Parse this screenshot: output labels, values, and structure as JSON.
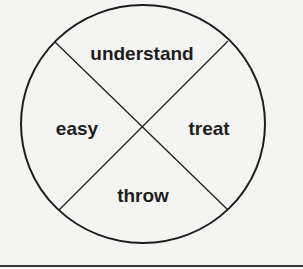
{
  "diagram": {
    "type": "circle-divided-into-quadrants",
    "circle": {
      "cx": 143,
      "cy": 124,
      "rx": 122,
      "ry": 119
    },
    "dividers": [
      {
        "x1": 55,
        "y1": 42,
        "x2": 228,
        "y2": 210
      },
      {
        "x1": 228,
        "y1": 41,
        "x2": 59,
        "y2": 210
      }
    ],
    "quadrants": {
      "top": {
        "label": "understand",
        "x": 142,
        "y": 53
      },
      "left": {
        "label": "easy",
        "x": 77,
        "y": 128
      },
      "right": {
        "label": "treat",
        "x": 209,
        "y": 128
      },
      "bottom": {
        "label": "throw",
        "x": 143,
        "y": 195
      }
    },
    "colors": {
      "stroke": "#1e1e1e",
      "text": "#1e1e1e",
      "background": "#f4f4f2",
      "rule": "#3a3a3a"
    }
  }
}
